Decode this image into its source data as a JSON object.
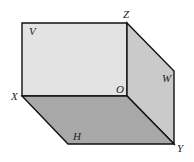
{
  "diagram": {
    "type": "three-projection-planes",
    "labels": {
      "V": "V",
      "W": "W",
      "H": "H",
      "X": "X",
      "Y": "Y",
      "Z": "Z",
      "O": "O"
    },
    "colors": {
      "V_plane": "#e2e2e2",
      "W_plane": "#c9c9c9",
      "H_plane": "#a9a9a9",
      "edge": "#111111"
    }
  }
}
